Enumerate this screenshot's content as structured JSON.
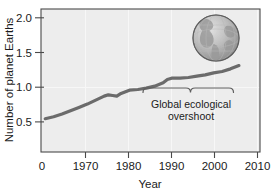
{
  "chart_data": {
    "type": "line",
    "title": "",
    "xlabel": "Year",
    "ylabel": "Number of planet Earths",
    "xlim": [
      1960,
      2012
    ],
    "ylim": [
      0,
      2.15
    ],
    "xticks": [
      1970,
      1980,
      1990,
      2000,
      2010
    ],
    "xticklabels": [
      "1970",
      "1980",
      "1990",
      "2000",
      "2010"
    ],
    "origin_label": "0",
    "yticks": [
      0.5,
      1.0,
      1.5,
      2.0
    ],
    "yticklabels": [
      "0.5",
      "1.0",
      "1.5",
      "2.0"
    ],
    "grid": "vertical-faint",
    "legend": "none",
    "series": [
      {
        "name": "Ecological footprint (number of planet Earths)",
        "color": "#6b6b6b",
        "x": [
          1961,
          1963,
          1965,
          1967,
          1969,
          1971,
          1973,
          1975,
          1976,
          1977,
          1978,
          1979,
          1981,
          1983,
          1985,
          1987,
          1989,
          1990,
          1991,
          1993,
          1995,
          1997,
          1999,
          2001,
          2003,
          2005,
          2007
        ],
        "values": [
          0.5,
          0.53,
          0.57,
          0.62,
          0.67,
          0.72,
          0.78,
          0.84,
          0.86,
          0.85,
          0.84,
          0.88,
          0.93,
          0.94,
          0.96,
          0.99,
          1.04,
          1.09,
          1.11,
          1.11,
          1.12,
          1.14,
          1.16,
          1.19,
          1.21,
          1.25,
          1.3
        ]
      }
    ],
    "annotations": [
      {
        "name": "overshoot-brace",
        "text_line1": "Global ecological",
        "text_line2": "overshoot",
        "x_start": 1987,
        "x_end": 2009,
        "y": 1.0
      }
    ],
    "decorations": [
      {
        "name": "globe-icon",
        "description": "grayscale globe showing the Americas"
      }
    ]
  }
}
